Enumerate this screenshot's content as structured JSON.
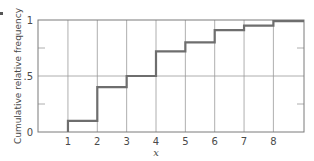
{
  "chart_data": {
    "type": "line",
    "subtype": "step",
    "title": "",
    "xlabel": "x",
    "ylabel": "Cumulative relative frequency",
    "x_ticks": [
      "1",
      "2",
      "3",
      "4",
      "5",
      "6",
      "7",
      "8"
    ],
    "y_ticks": [
      "0",
      ".5",
      "1"
    ],
    "y_minor_ticks": [
      0.25,
      0.75
    ],
    "xlim": [
      0,
      9
    ],
    "ylim": [
      0,
      1
    ],
    "grid": {
      "vertical_at_x_ticks": true,
      "horizontal_at": [
        0.5
      ]
    },
    "series": [
      {
        "name": "Cumulative relative frequency",
        "x": [
          1,
          2,
          3,
          4,
          5,
          6,
          7,
          8
        ],
        "values": [
          0.1,
          0.4,
          0.5,
          0.72,
          0.8,
          0.91,
          0.95,
          0.99
        ]
      }
    ],
    "colors": {
      "line": "#6e6e6e",
      "grid": "#9a9a9a",
      "frame": "#7a7a7a"
    }
  }
}
